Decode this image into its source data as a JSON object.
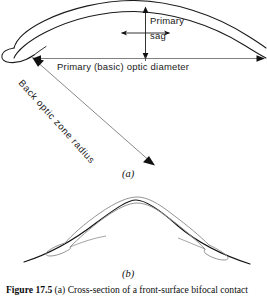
{
  "figure": {
    "caption_number": "Figure 17.5",
    "caption_text": " (a) Cross-section of a front-surface bifocal contact",
    "panels": [
      {
        "letter": "(a)",
        "name": "lens-cross-section"
      },
      {
        "letter": "(b)",
        "name": "lens-on-cornea"
      }
    ]
  },
  "annotations": {
    "primary_sag_line1": "Primary",
    "primary_sag_line2": "sag",
    "optic_diameter": "Primary (basic) optic diameter",
    "back_optic_zone_radius": "Back optic zone radius"
  },
  "colors": {
    "ink": "#111111",
    "lens_outline": "#1a1a1a",
    "lens_light": "#8d8d8d",
    "cornea": "#111111",
    "leader": "#555555",
    "background": "#ffffff"
  }
}
